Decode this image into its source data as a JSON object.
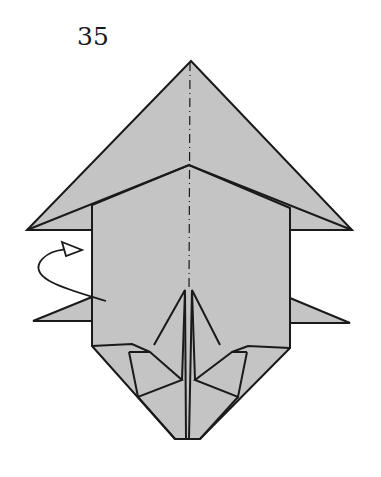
{
  "diagram": {
    "step_number": "35",
    "colors": {
      "paper": "#c4c4c4",
      "line": "#1a1a1a",
      "background": "#ffffff"
    },
    "annotations": [
      {
        "type": "mountain-fold-line",
        "description": "vertical dash-dot center line"
      },
      {
        "type": "fold-behind-arrow",
        "description": "curved arrow with hollow triangle head on left side"
      }
    ]
  }
}
